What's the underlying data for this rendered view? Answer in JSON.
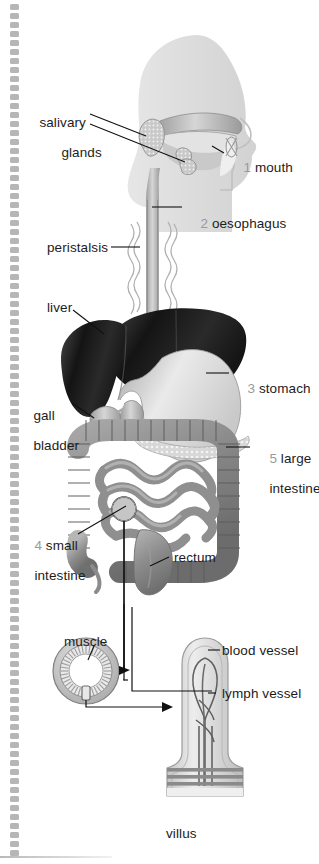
{
  "figure": {
    "background": "#ffffff",
    "text_color": "#1c1c1c",
    "number_color": "#9a9a9a",
    "leader_line_color": "#111111"
  },
  "border": {
    "name": "dotted-bead-strip",
    "x": 10,
    "width": 9,
    "top": 4,
    "bottom": 858,
    "bead_color": "#a9a9a9",
    "bead_pitch": 9
  },
  "labels": [
    {
      "id": "salivary-glands",
      "text": "salivary\nglands",
      "line1": "salivary",
      "line2": "glands",
      "x": 24,
      "y": 100,
      "number": ""
    },
    {
      "id": "mouth",
      "text": "1 mouth",
      "number": "1",
      "name": "mouth",
      "x": 228,
      "y": 145
    },
    {
      "id": "oesophagus",
      "text": "2 oesophagus",
      "number": "2",
      "name": "oesophagus",
      "x": 185,
      "y": 201
    },
    {
      "id": "peristalsis",
      "text": "peristalsis",
      "number": "",
      "name": "peristalsis",
      "x": 47,
      "y": 241
    },
    {
      "id": "liver",
      "text": "liver",
      "number": "",
      "name": "liver",
      "x": 47,
      "y": 300
    },
    {
      "id": "stomach",
      "text": "3 stomach",
      "number": "3",
      "name": "stomach",
      "x": 232,
      "y": 367
    },
    {
      "id": "gall-bladder",
      "text": "gall\nbladder",
      "line1": "gall",
      "line2": "bladder",
      "x": 18,
      "y": 394,
      "number": ""
    },
    {
      "id": "large-intestine",
      "text": "5 large\nintestine",
      "line1": "5 large",
      "line2": "intestine",
      "number": "5",
      "x": 254,
      "y": 436
    },
    {
      "id": "small-intestine",
      "text": "4 small\nintestine",
      "line1": "4 small",
      "line2": "intestine",
      "number": "4",
      "x": 19,
      "y": 523
    },
    {
      "id": "rectum",
      "text": "rectum",
      "number": "",
      "name": "rectum",
      "x": 172,
      "y": 550
    },
    {
      "id": "muscle",
      "text": "muscle",
      "number": "",
      "name": "muscle",
      "x": 64,
      "y": 634
    },
    {
      "id": "blood-vessel",
      "text": "blood vessel",
      "number": "",
      "name": "blood vessel",
      "x": 212,
      "y": 644
    },
    {
      "id": "lymph-vessel",
      "text": "lymph vessel",
      "number": "",
      "name": "lymph vessel",
      "x": 212,
      "y": 687
    },
    {
      "id": "villus",
      "text": "villus",
      "number": "",
      "name": "villus",
      "x": 166,
      "y": 827
    }
  ],
  "organs": [
    {
      "id": "head",
      "name": "head-silhouette",
      "fill": "#dcdcdc"
    },
    {
      "id": "salivary-gland-upper",
      "name": "parotid-gland",
      "fill": "#c8c8c8"
    },
    {
      "id": "salivary-gland-lower",
      "name": "submandibular-gland",
      "fill": "#c8c8c8"
    },
    {
      "id": "mouth-opening",
      "name": "mouth",
      "fill": "#e8e8e8"
    },
    {
      "id": "tongue",
      "name": "tongue",
      "fill": "#bdbdbd"
    },
    {
      "id": "oesophagus-tube",
      "name": "oesophagus",
      "fill": "#b4b4b4"
    },
    {
      "id": "peristalsis-waves",
      "name": "peristalsis-wave",
      "fill": "#bdbdbd"
    },
    {
      "id": "liver-body",
      "name": "liver",
      "fill": "#2b2b2b"
    },
    {
      "id": "gall-bladder-body",
      "name": "gall-bladder",
      "fill": "#c0c0c0"
    },
    {
      "id": "stomach-body",
      "name": "stomach",
      "fill": "#d8d8d8"
    },
    {
      "id": "pancreas",
      "name": "pancreas",
      "fill": "#d0d0d0"
    },
    {
      "id": "large-intestine-body",
      "name": "large-intestine",
      "fill": "#9b9b9b"
    },
    {
      "id": "small-intestine-body",
      "name": "small-intestine",
      "fill": "#8f8f8f"
    },
    {
      "id": "rectum-body",
      "name": "rectum",
      "fill": "#8a8a8a"
    },
    {
      "id": "muscle-ring",
      "name": "muscle-cross-section",
      "fill": "#c4c4c4"
    },
    {
      "id": "villus-body",
      "name": "villus",
      "fill": "#dadada"
    },
    {
      "id": "blood-vessel-loop",
      "name": "blood-vessel",
      "fill": "#6d6d6d"
    },
    {
      "id": "lymph-vessel-line",
      "name": "lymph-vessel",
      "fill": "#6d6d6d"
    }
  ],
  "callout": {
    "circle_name": "small-intestine-zoom-circle",
    "arrow_to_muscle": "muscle-ring",
    "arrow_to_villus": "villus"
  }
}
